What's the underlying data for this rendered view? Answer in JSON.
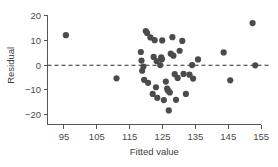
{
  "chart_data": {
    "type": "scatter",
    "title": "",
    "xlabel": "Fitted value",
    "ylabel": "Residual",
    "xlim": [
      90,
      158
    ],
    "ylim": [
      -24,
      21
    ],
    "xticks": [
      95,
      105,
      115,
      125,
      135,
      145,
      155
    ],
    "xtick_labels": [
      "95",
      "105",
      "115",
      "125",
      "135",
      "145",
      "155"
    ],
    "yticks": [
      20,
      10,
      0,
      -10,
      -20
    ],
    "ytick_labels": [
      "20",
      "10",
      "0",
      "-10",
      "-20"
    ],
    "grid": false,
    "legend": null,
    "reference_line": {
      "orientation": "horizontal",
      "value": 0,
      "style": "dashed",
      "color": "#2b2b2b"
    },
    "marker": {
      "shape": "circle",
      "color": "#4b4b4b",
      "size": 3.1
    },
    "series": [
      {
        "name": "Residuals",
        "points": [
          [
            95.6,
            12.2
          ],
          [
            111.0,
            -5.3
          ],
          [
            118.4,
            5.4
          ],
          [
            118.6,
            1.9
          ],
          [
            118.8,
            -2.2
          ],
          [
            119.2,
            -0.5
          ],
          [
            119.4,
            -5.9
          ],
          [
            119.9,
            13.9
          ],
          [
            120.3,
            13.1
          ],
          [
            120.6,
            -7.1
          ],
          [
            121.3,
            11.3
          ],
          [
            122.0,
            -11.6
          ],
          [
            122.3,
            3.4
          ],
          [
            122.6,
            10.2
          ],
          [
            123.0,
            -8.9
          ],
          [
            123.2,
            1.7
          ],
          [
            123.4,
            -13.2
          ],
          [
            124.3,
            0.1
          ],
          [
            124.6,
            3.2
          ],
          [
            124.8,
            2.5
          ],
          [
            124.9,
            10.1
          ],
          [
            125.4,
            -14.1
          ],
          [
            126.0,
            -6.6
          ],
          [
            126.4,
            -9.4
          ],
          [
            126.6,
            -10.2
          ],
          [
            126.9,
            -18.3
          ],
          [
            127.2,
            -11.0
          ],
          [
            127.5,
            4.7
          ],
          [
            128.0,
            11.4
          ],
          [
            128.3,
            3.9
          ],
          [
            128.7,
            -3.6
          ],
          [
            129.1,
            -14.0
          ],
          [
            129.6,
            -5.1
          ],
          [
            130.2,
            5.9
          ],
          [
            131.0,
            9.9
          ],
          [
            131.4,
            -3.5
          ],
          [
            132.1,
            -11.6
          ],
          [
            133.2,
            -3.8
          ],
          [
            134.0,
            0.1
          ],
          [
            134.3,
            -5.4
          ],
          [
            135.8,
            2.4
          ],
          [
            143.6,
            5.2
          ],
          [
            145.6,
            -6.1
          ],
          [
            152.4,
            17.1
          ],
          [
            153.2,
            0.0
          ]
        ]
      }
    ]
  },
  "axes": {
    "y_axis_title": "Residual",
    "x_axis_title": "Fitted value"
  }
}
